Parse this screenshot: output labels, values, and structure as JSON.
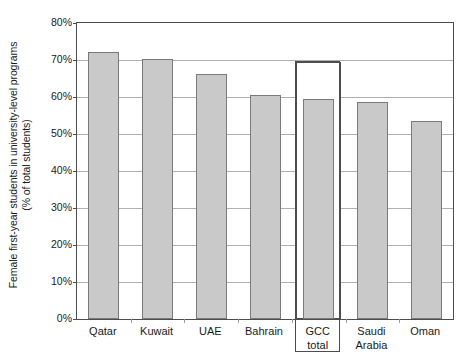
{
  "chart_data": {
    "type": "bar",
    "title": "",
    "subtitle": "",
    "xlabel": "",
    "ylabel_line1": "Female first-year students in university-level programs",
    "ylabel_line2": "(% of total students)",
    "categories": [
      "Qatar",
      "Kuwait",
      "UAE",
      "Bahrain",
      "GCC total",
      "Saudi Arabia",
      "Oman"
    ],
    "values": [
      72.2,
      70.2,
      66.2,
      60.5,
      59.4,
      58.6,
      53.5
    ],
    "series": [
      {
        "name": "Female first-year students (% of total students)",
        "values": [
          72.2,
          70.2,
          66.2,
          60.5,
          59.4,
          58.6,
          53.5
        ]
      }
    ],
    "highlight": {
      "category": "GCC total",
      "index": 4,
      "outline_value": 69.5,
      "note": "GCC total bar is enclosed in an open outlined box reaching about 69.5%"
    },
    "ylim": [
      0,
      80
    ],
    "ytick_step": 10,
    "ytick_labels": [
      "80%",
      "70%",
      "60%",
      "50%",
      "40%",
      "30%",
      "20%",
      "10%",
      "0%"
    ],
    "ytick_values": [
      80,
      70,
      60,
      50,
      40,
      30,
      20,
      10,
      0
    ],
    "grid": true,
    "grid_axis": "y",
    "legend": false,
    "legend_position": "none",
    "colors": {
      "bar_fill": "#c9c9c9",
      "bar_stroke": "#7a7a7a",
      "frame": "#4d4d4d",
      "gridline": "#b0b0b0",
      "background": "#ffffff",
      "text": "#1a1a1a"
    }
  },
  "x_label_lines": [
    [
      "Qatar"
    ],
    [
      "Kuwait"
    ],
    [
      "UAE"
    ],
    [
      "Bahrain"
    ],
    [
      "GCC",
      "total"
    ],
    [
      "Saudi",
      "Arabia"
    ],
    [
      "Oman"
    ]
  ]
}
